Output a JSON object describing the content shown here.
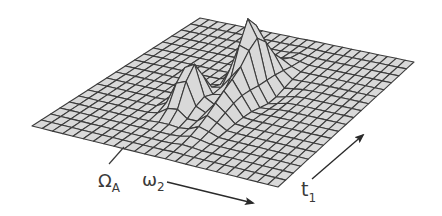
{
  "figure": {
    "surface": {
      "grid_cols": 24,
      "grid_rows": 18,
      "corners": {
        "front_left": [
          32,
          126
        ],
        "front_right": [
          278,
          187
        ],
        "back_right": [
          414,
          62
        ],
        "back_left": [
          200,
          18
        ]
      },
      "fill_color": "#d9d9d9",
      "line_color": "#3c3c3c",
      "peaks": [
        {
          "name": "peak-left",
          "u": 0.4,
          "v": 0.38,
          "height": 48,
          "width_u": 0.035,
          "width_v": 0.06
        },
        {
          "name": "peak-center",
          "u": 0.5,
          "v": 0.62,
          "height": 62,
          "width_u": 0.035,
          "width_v": 0.07
        },
        {
          "name": "ridge-center",
          "u": 0.55,
          "v": 0.5,
          "height": 30,
          "width_u": 0.03,
          "width_v": 0.16
        },
        {
          "name": "valley",
          "u": 0.6,
          "v": 0.58,
          "height": -8,
          "width_u": 0.05,
          "width_v": 0.08
        }
      ]
    },
    "axes": {
      "omega_a": {
        "label": "Ω",
        "subscript": "A"
      },
      "omega_2": {
        "label": "ω",
        "subscript": "2"
      },
      "t_1": {
        "label": "t",
        "subscript": "1"
      }
    }
  }
}
